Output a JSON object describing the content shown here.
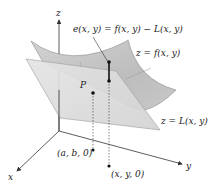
{
  "figure": {
    "axes": {
      "x_label": "x",
      "y_label": "y",
      "z_label": "z"
    },
    "labels": {
      "error": "e(x, y) = f(x, y) − L(x, y)",
      "surface": "z = f(x, y)",
      "plane": "z = L(x, y)",
      "point_p": "P",
      "point_ab": "(a, b, 0)",
      "point_xy": "(x, y, 0)"
    },
    "colors": {
      "surface_fill": "#c9c9c9",
      "surface_edge": "#8a8a8a",
      "plane_fill": "#dcdcdc",
      "plane_edge": "#9a9a9a",
      "axis": "#333333",
      "point": "#111111"
    }
  }
}
